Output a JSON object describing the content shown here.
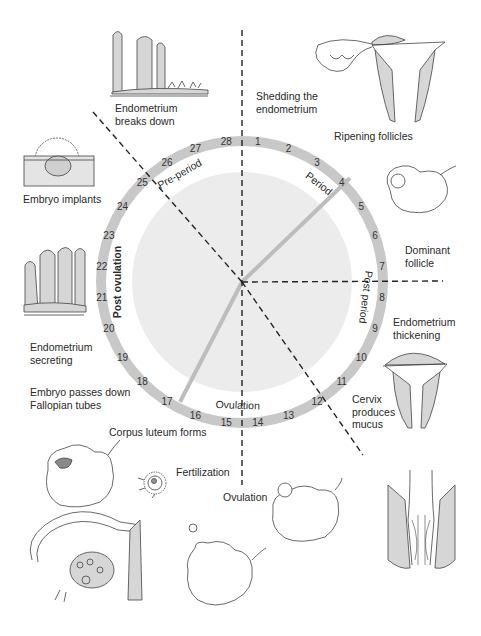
{
  "diagram": {
    "center": {
      "x": 242,
      "y": 282
    },
    "ring": {
      "outer_r": 146,
      "inner_r": 136,
      "color": "#c8c8c8"
    },
    "inner_disk": {
      "r": 110,
      "color": "#ececec"
    },
    "day_numbers": [
      "1",
      "2",
      "3",
      "4",
      "5",
      "6",
      "7",
      "8",
      "9",
      "10",
      "11",
      "12",
      "13",
      "14",
      "15",
      "16",
      "17",
      "18",
      "19",
      "20",
      "21",
      "22",
      "23",
      "24",
      "25",
      "26",
      "27",
      "28"
    ],
    "phases": [
      {
        "label": "Period",
        "angle": 38
      },
      {
        "label": "Post period",
        "angle": 97
      },
      {
        "label": "Ovulation",
        "angle": 182
      },
      {
        "label": "Post ovulation",
        "angle": 270,
        "bold": true
      },
      {
        "label": "Pre-period",
        "angle": 330
      }
    ],
    "dashed_lines": [
      {
        "from": [
          242,
          30
        ],
        "to": [
          242,
          485
        ]
      },
      {
        "from": [
          242,
          282
        ],
        "to": [
          443,
          281
        ]
      },
      {
        "from": [
          93,
          112
        ],
        "to": [
          242,
          282
        ]
      },
      {
        "from": [
          242,
          282
        ],
        "to": [
          363,
          455
        ]
      }
    ],
    "solid_spokes": [
      {
        "to_day": "4",
        "to": [
          350,
          178
        ]
      },
      {
        "to_day": "16",
        "to": [
          180,
          402
        ]
      }
    ],
    "spoke_color": "#bdbdbd",
    "illustration_fill": "#d6d6d6"
  },
  "labels": {
    "endometrium_breaks_down": [
      "Endometrium",
      "breaks down"
    ],
    "shedding_endometrium": [
      "Shedding the",
      "endometrium"
    ],
    "ripening_follicles": [
      "Ripening follicles"
    ],
    "embryo_implants": [
      "Embryo implants"
    ],
    "dominant_follicle": [
      "Dominant",
      "follicle"
    ],
    "endometrium_thickening": [
      "Endometrium",
      "thickening"
    ],
    "endometrium_secreting": [
      "Endometrium",
      "secreting"
    ],
    "embryo_passes_down": [
      "Embryo passes down",
      "Fallopian tubes"
    ],
    "cervix_produces_mucus": [
      "Cervix",
      "produces",
      "mucus"
    ],
    "corpus_luteum_forms": [
      "Corpus luteum forms"
    ],
    "fertilization": [
      "Fertilization"
    ],
    "ovulation": [
      "Ovulation"
    ]
  }
}
